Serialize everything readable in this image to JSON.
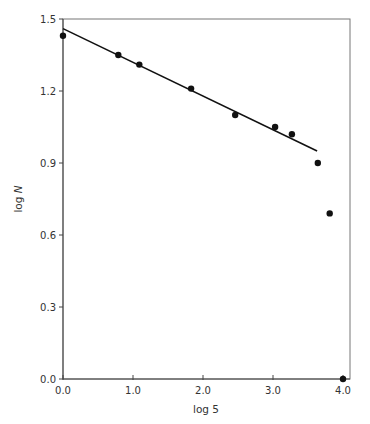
{
  "chart_data": {
    "type": "scatter",
    "title": "",
    "xlabel": "log 5",
    "ylabel": "log N",
    "xlim": [
      0.0,
      4.0
    ],
    "ylim": [
      0.0,
      1.5
    ],
    "grid": false,
    "legend": null,
    "x_ticks": [
      "0.0",
      "1.0",
      "2.0",
      "3.0",
      "4.0"
    ],
    "y_ticks": [
      "0.0",
      "0.3",
      "0.6",
      "0.9",
      "1.2",
      "1.5"
    ],
    "series": [
      {
        "name": "observed",
        "type": "scatter",
        "marker": "filled-circle",
        "color": "#111111",
        "x": [
          0.0,
          0.79,
          1.09,
          1.83,
          2.46,
          3.03,
          3.27,
          3.64,
          3.81,
          4.0
        ],
        "y": [
          1.43,
          1.35,
          1.31,
          1.21,
          1.1,
          1.05,
          1.02,
          0.9,
          0.69,
          0.0
        ]
      },
      {
        "name": "fit",
        "type": "line",
        "color": "#111111",
        "x": [
          0.0,
          3.63
        ],
        "y": [
          1.46,
          0.95
        ]
      }
    ]
  },
  "labels": {
    "xlabel": "log 5",
    "ylabel_prefix": "log ",
    "ylabel_var": "N"
  }
}
